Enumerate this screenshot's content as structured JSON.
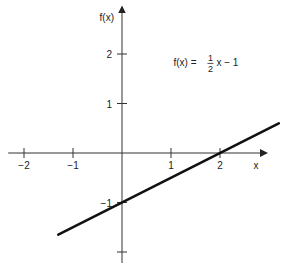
{
  "chart_data": {
    "type": "line",
    "title": "",
    "xlabel": "x",
    "ylabel": "f(x)",
    "xlim": [
      -2.2,
      3.0
    ],
    "ylim": [
      -2.2,
      2.9
    ],
    "grid": false,
    "legend": "none",
    "x_ticks": [
      {
        "value": -2,
        "label": "−2"
      },
      {
        "value": -1,
        "label": "−1"
      },
      {
        "value": 1,
        "label": "1"
      },
      {
        "value": 2,
        "label": "2"
      }
    ],
    "y_ticks": [
      {
        "value": 2,
        "label": "2"
      },
      {
        "value": 1,
        "label": "1"
      },
      {
        "value": -1,
        "label": "−1"
      },
      {
        "value": -2,
        "label": ""
      }
    ],
    "series": [
      {
        "name": "f(x) = 1/2 x − 1",
        "slope": 0.5,
        "intercept": -1,
        "x": [
          -1.3,
          3.2
        ],
        "y": [
          -1.65,
          0.6
        ]
      }
    ],
    "annotation": {
      "prefix": "f(x) =",
      "frac_num": "1",
      "frac_den": "2",
      "suffix": "x − 1",
      "anchor_x": 1.05,
      "anchor_y": 1.75
    }
  }
}
